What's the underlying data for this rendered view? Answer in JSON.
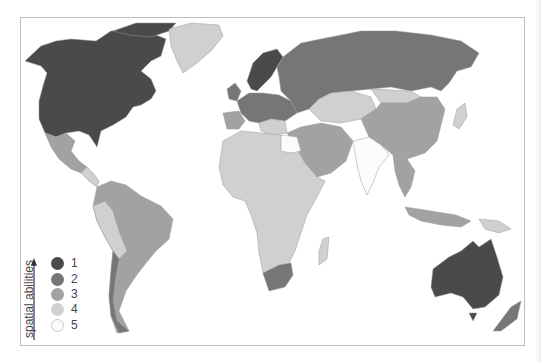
{
  "map": {
    "title": "World map of spatial abilities by country",
    "colors": {
      "level_1": "#4a4a4a",
      "level_2": "#767676",
      "level_3": "#a2a2a2",
      "level_4": "#d0d0d0",
      "level_5": "#fbfbfb",
      "ocean": "#ffffff",
      "border": "#9a9a9a"
    },
    "regions": [
      {
        "name": "North America (USA, Canada)",
        "level": 1
      },
      {
        "name": "Greenland",
        "level": 4
      },
      {
        "name": "Mexico",
        "level": 3
      },
      {
        "name": "Central America",
        "level": 4
      },
      {
        "name": "South America (Brazil, Argentina, Colombia)",
        "level": 3
      },
      {
        "name": "South America (Peru, Bolivia, Venezuela)",
        "level": 4
      },
      {
        "name": "Chile",
        "level": 2
      },
      {
        "name": "Scandinavia",
        "level": 1
      },
      {
        "name": "Western & Central Europe",
        "level": 2
      },
      {
        "name": "Spain / Southern Europe",
        "level": 3
      },
      {
        "name": "Russia",
        "level": 2
      },
      {
        "name": "Kazakhstan / Central Asia",
        "level": 4
      },
      {
        "name": "China",
        "level": 3
      },
      {
        "name": "Mongolia",
        "level": 4
      },
      {
        "name": "Middle East",
        "level": 3
      },
      {
        "name": "India",
        "level": 5
      },
      {
        "name": "Africa",
        "level": 4
      },
      {
        "name": "Egypt",
        "level": 5
      },
      {
        "name": "South Africa",
        "level": 2
      },
      {
        "name": "Southeast Asia",
        "level": 3
      },
      {
        "name": "Australia",
        "level": 1
      },
      {
        "name": "New Zealand",
        "level": 2
      }
    ]
  },
  "legend": {
    "title": "spatial abilities",
    "items": [
      {
        "label": "1",
        "color": "#4a4a4a"
      },
      {
        "label": "2",
        "color": "#767676"
      },
      {
        "label": "3",
        "color": "#a2a2a2"
      },
      {
        "label": "4",
        "color": "#d0d0d0"
      },
      {
        "label": "5",
        "color": "#fbfbfb"
      }
    ]
  }
}
